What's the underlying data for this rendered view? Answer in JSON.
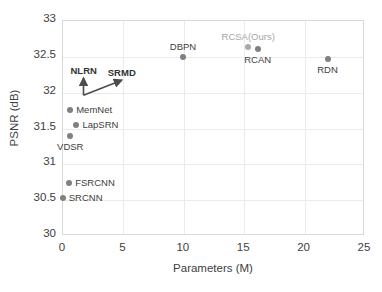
{
  "chart_data": {
    "type": "scatter",
    "title": "",
    "xlabel": "Parameters (M)",
    "ylabel": "PSNR (dB)",
    "xlim": [
      0,
      25
    ],
    "ylim": [
      30,
      33
    ],
    "xticks": [
      "0",
      "5",
      "10",
      "15",
      "20",
      "25"
    ],
    "yticks": [
      "30",
      "30.5",
      "31",
      "31.5",
      "32",
      "32.5",
      "33"
    ],
    "grid": true,
    "legend": "none",
    "points": [
      {
        "label": "SRCNN",
        "x": 0.06,
        "y": 30.52,
        "label_pos": "right",
        "highlight": false
      },
      {
        "label": "FSRCNN",
        "x": 0.6,
        "y": 30.72,
        "label_pos": "right",
        "highlight": false
      },
      {
        "label": "VDSR",
        "x": 0.67,
        "y": 31.38,
        "label_pos": "below",
        "highlight": false
      },
      {
        "label": "LapSRN",
        "x": 1.2,
        "y": 31.54,
        "label_pos": "right",
        "highlight": false
      },
      {
        "label": "MemNet",
        "x": 0.68,
        "y": 31.74,
        "label_pos": "right",
        "highlight": false
      },
      {
        "label": "DBPN",
        "x": 10.0,
        "y": 32.49,
        "label_pos": "above",
        "highlight": false
      },
      {
        "label": "RCSA(Ours)",
        "x": 15.4,
        "y": 32.63,
        "label_pos": "above",
        "highlight": true
      },
      {
        "label": "RCAN",
        "x": 16.2,
        "y": 32.6,
        "label_pos": "below",
        "highlight": false
      },
      {
        "label": "RDN",
        "x": 22.0,
        "y": 32.46,
        "label_pos": "below",
        "highlight": false
      }
    ],
    "annotations": [
      {
        "label": "NLRN",
        "from_x": 1.78,
        "from_y": 31.95,
        "to_x": 1.78,
        "to_y": 32.19
      },
      {
        "label": "SRMD",
        "from_x": 1.78,
        "from_y": 31.95,
        "to_x": 4.95,
        "to_y": 32.16
      }
    ]
  }
}
